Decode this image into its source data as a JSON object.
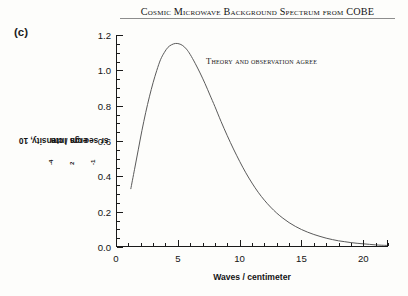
{
  "panel": {
    "label": "(c)"
  },
  "header": {
    "title": "Cosmic Microwave Background Spectrum from COBE"
  },
  "chart_data": {
    "type": "line",
    "title": "Cosmic Microwave Background Spectrum from COBE",
    "xlabel": "Waves / centimeter",
    "ylabel": "Intensity, 10⁻⁴ ergs / cm² sr sec cm⁻¹",
    "ylabel_parts": {
      "prefix": "Intensity, 10",
      "exp1": "-4",
      "mid": " ergs / cm",
      "exp2": "2",
      "mid2": " sr sec cm",
      "exp3": "-1"
    },
    "annotation": "Theory and observation agree",
    "xlim": [
      0,
      22
    ],
    "ylim": [
      0,
      1.2
    ],
    "xticks": [
      0,
      5,
      10,
      15,
      20
    ],
    "xtick_labels": [
      "0",
      "5",
      "10",
      "15",
      "20"
    ],
    "xtick_minor_step": 1,
    "yticks": [
      0.0,
      0.2,
      0.4,
      0.6,
      0.8,
      1.0,
      1.2
    ],
    "ytick_labels": [
      "0.0",
      "0.2",
      "0.4",
      "0.6",
      "0.8",
      "1.0",
      "1.2"
    ],
    "ytick_minor_step": 0.05,
    "grid": false,
    "legend": null,
    "line_color": "#5a5a5a",
    "line_width": 1.0,
    "peak": {
      "x": 5.3,
      "y": 1.15
    },
    "series": [
      {
        "name": "Blackbody spectrum 2.725 K",
        "x": [
          1.2,
          1.5,
          1.8,
          2.1,
          2.4,
          2.7,
          3.0,
          3.3,
          3.6,
          3.9,
          4.2,
          4.5,
          4.8,
          5.1,
          5.4,
          5.7,
          6.0,
          6.4,
          6.8,
          7.2,
          7.6,
          8.0,
          8.5,
          9.0,
          9.5,
          10.0,
          10.5,
          11.0,
          11.5,
          12.0,
          12.5,
          13.0,
          13.5,
          14.0,
          14.5,
          15.0,
          15.5,
          16.0,
          16.5,
          17.0,
          17.5,
          18.0,
          18.5,
          19.0,
          19.5,
          20.0,
          20.5,
          21.0,
          21.5,
          21.9
        ],
        "y": [
          0.33,
          0.44,
          0.55,
          0.66,
          0.76,
          0.85,
          0.93,
          1.0,
          1.06,
          1.1,
          1.13,
          1.145,
          1.152,
          1.15,
          1.14,
          1.12,
          1.09,
          1.04,
          0.985,
          0.925,
          0.86,
          0.795,
          0.71,
          0.63,
          0.555,
          0.485,
          0.42,
          0.362,
          0.31,
          0.265,
          0.226,
          0.192,
          0.163,
          0.138,
          0.117,
          0.099,
          0.084,
          0.071,
          0.06,
          0.05,
          0.042,
          0.035,
          0.03,
          0.025,
          0.021,
          0.018,
          0.015,
          0.012,
          0.01,
          0.009
        ]
      }
    ]
  }
}
